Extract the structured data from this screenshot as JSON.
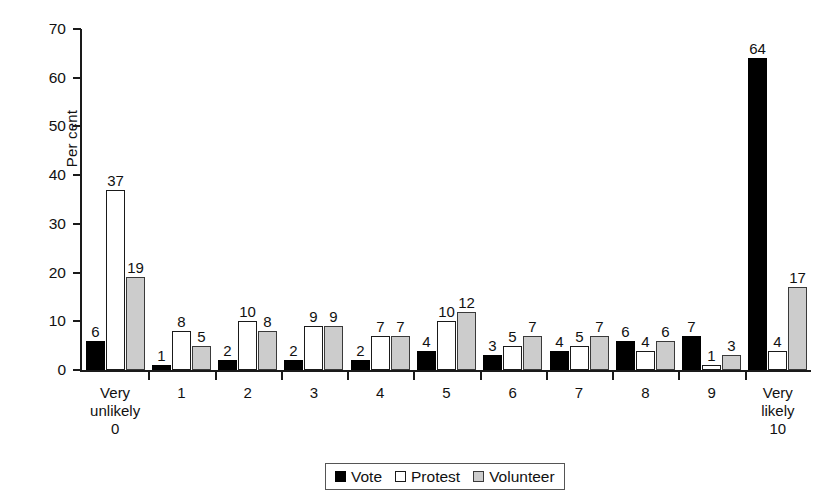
{
  "chart_data": {
    "type": "bar",
    "title": "",
    "xlabel": "",
    "ylabel": "Per cent",
    "ylim": [
      0,
      70
    ],
    "ytick_step": 10,
    "yticks": [
      0,
      10,
      20,
      30,
      40,
      50,
      60,
      70
    ],
    "grid": false,
    "legend_position": "bottom",
    "categories": [
      "Very\nunlikely\n0",
      "1",
      "2",
      "3",
      "4",
      "5",
      "6",
      "7",
      "8",
      "9",
      "Very\nlikely\n10"
    ],
    "series": [
      {
        "name": "Vote",
        "color": "#000000",
        "values": [
          6,
          1,
          2,
          2,
          2,
          4,
          3,
          4,
          6,
          7,
          64
        ]
      },
      {
        "name": "Protest",
        "color": "#ffffff",
        "values": [
          37,
          8,
          10,
          9,
          7,
          10,
          5,
          5,
          4,
          1,
          4
        ]
      },
      {
        "name": "Volunteer",
        "color": "#cccccc",
        "values": [
          19,
          5,
          8,
          9,
          7,
          12,
          7,
          7,
          6,
          3,
          17
        ]
      }
    ]
  },
  "legend": {
    "items": [
      {
        "label": "Vote",
        "swatch": "vote"
      },
      {
        "label": "Protest",
        "swatch": "protest"
      },
      {
        "label": "Volunteer",
        "swatch": "volunteer"
      }
    ]
  },
  "axis": {
    "y_title": "Per cent"
  }
}
